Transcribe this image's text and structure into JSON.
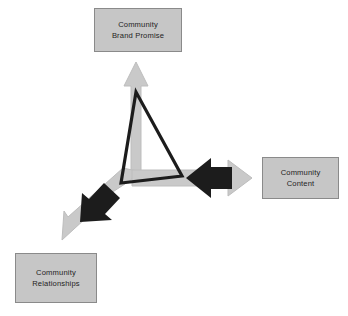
{
  "diagram": {
    "type": "three-way-arrow-venn",
    "background_color": "#ffffff",
    "palette": {
      "box_fill": "#c6c6c6",
      "box_border": "#8a8a8a",
      "box_text": "#232323",
      "arrow_light_gray": "#c9c9c9",
      "arrow_light_gray_edge": "#b4b4b4",
      "arrow_black": "#1c1c1c",
      "triangle_outline": "#1c1c1c"
    },
    "center_point": {
      "x": 136,
      "y": 176
    },
    "nodes": [
      {
        "id": "brand-promise",
        "label": "Community\nBrand Promise",
        "position": "top"
      },
      {
        "id": "content",
        "label": "Community\nContent",
        "position": "right"
      },
      {
        "id": "relationships",
        "label": "Community\nRelationships",
        "position": "bottom-left"
      }
    ],
    "arrows": [
      {
        "id": "arrow-up",
        "direction": "up",
        "color": "#c9c9c9",
        "points_to": "brand-promise",
        "has_black_arrowhead": false
      },
      {
        "id": "arrow-right",
        "direction": "right",
        "color": "#c9c9c9",
        "points_to": "content",
        "has_black_arrowhead": true,
        "black_arrowhead_direction": "left"
      },
      {
        "id": "arrow-down-left",
        "direction": "down-left",
        "color": "#c9c9c9",
        "points_to": "relationships",
        "has_black_arrowhead": true,
        "black_arrowhead_direction": "down-left"
      }
    ],
    "triangle": {
      "id": "center-triangle",
      "stroke": "#1c1c1c",
      "fill": "none",
      "stroke_width": 3,
      "vertices": [
        {
          "x": 136,
          "y": 92
        },
        {
          "x": 121,
          "y": 183
        },
        {
          "x": 182,
          "y": 176
        }
      ]
    }
  }
}
